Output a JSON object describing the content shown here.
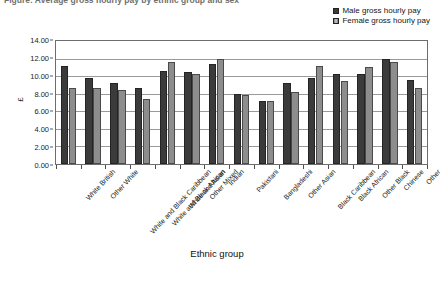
{
  "figure": {
    "clipped_title": "Figure: Average gross hourly pay by ethnic group and sex",
    "axis_title_x": "Ethnic group",
    "axis_title_y": "£"
  },
  "legend": {
    "position": "top-right",
    "entries": [
      {
        "label": "Male gross hourly pay",
        "color": "#3b3b3b"
      },
      {
        "label": "Female gross hourly pay",
        "color": "#8d8d8d"
      }
    ]
  },
  "yaxis": {
    "ticks": [
      "0.00",
      "2.00",
      "4.00",
      "6.00",
      "8.00",
      "10.00",
      "12.00",
      "14.00"
    ],
    "min": 0,
    "max": 14,
    "step": 2
  },
  "chart_data": {
    "type": "bar",
    "title": "Average gross hourly pay by ethnic group and sex",
    "xlabel": "Ethnic group",
    "ylabel": "£",
    "ylim": [
      0,
      14
    ],
    "ytick_step": 2,
    "grid": true,
    "legend_position": "top-right",
    "categories": [
      "White British",
      "Other White",
      "White and Black Caribbean",
      "White and Black African",
      "White and Asian",
      "Other Mixed",
      "Indian",
      "Pakistani",
      "Bangladeshi",
      "Other Asian",
      "Black Caribbean",
      "Black African",
      "Other Black",
      "Chinese",
      "Other"
    ],
    "series": [
      {
        "name": "Male gross hourly pay",
        "color": "#3b3b3b",
        "values": [
          11.1,
          9.8,
          9.2,
          8.6,
          10.6,
          10.5,
          11.4,
          8.0,
          7.2,
          9.2,
          9.8,
          10.3,
          10.2,
          11.9,
          9.6
        ]
      },
      {
        "name": "Female gross hourly pay",
        "color": "#8d8d8d",
        "values": [
          8.7,
          8.6,
          8.4,
          7.4,
          11.6,
          10.3,
          11.9,
          7.9,
          7.2,
          8.2,
          11.1,
          9.4,
          11.0,
          11.6,
          8.6
        ]
      }
    ]
  }
}
